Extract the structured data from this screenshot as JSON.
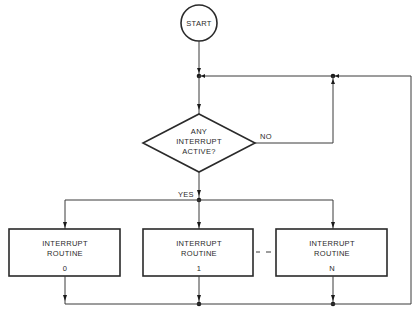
{
  "diagram": {
    "type": "flowchart",
    "nodes": {
      "start": {
        "label": "START",
        "shape": "circle"
      },
      "decision": {
        "lines": [
          "ANY",
          "INTERRUPT",
          "ACTIVE?"
        ],
        "shape": "diamond"
      },
      "routines": [
        {
          "lines": [
            "INTERRUPT",
            "ROUTINE"
          ],
          "index": "0"
        },
        {
          "lines": [
            "INTERRUPT",
            "ROUTINE"
          ],
          "index": "1"
        },
        {
          "lines": [
            "INTERRUPT",
            "ROUTINE"
          ],
          "index": "N"
        }
      ]
    },
    "edges": {
      "no_label": "NO",
      "yes_label": "YES",
      "ellipsis": "– –"
    },
    "colors": {
      "stroke": "#2a2a2a",
      "background": "#ffffff"
    }
  }
}
